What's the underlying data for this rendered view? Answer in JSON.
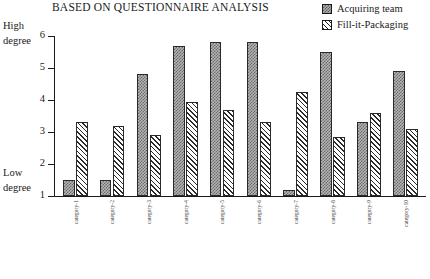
{
  "chart": {
    "title": "BASED ON QUESTIONNAIRE ANALYSIS",
    "axis": {
      "high_line1": "High",
      "high_line2": "degree",
      "low_line1": "Low",
      "low_line2": "degree",
      "ticks": [
        "6",
        "5",
        "4",
        "3",
        "2",
        "1"
      ]
    },
    "legend": [
      {
        "label": "Acquiring team",
        "swatch": "checker-swatch"
      },
      {
        "label": "Fill-it-Packaging",
        "swatch": "diagonal-hatch-swatch"
      }
    ]
  },
  "chart_data": {
    "type": "bar",
    "title": "BASED ON QUESTIONNAIRE ANALYSIS",
    "xlabel": "",
    "ylabel": "degree",
    "ylim": [
      1,
      6
    ],
    "yticks": [
      1,
      2,
      3,
      4,
      5,
      6
    ],
    "ytick_labels": [
      "1",
      "2",
      "3",
      "4",
      "5",
      "6"
    ],
    "y_axis_annotations": {
      "top": "High degree",
      "bottom": "Low degree"
    },
    "grid": false,
    "legend_position": "top-right",
    "categories": [
      "category-1",
      "category-2",
      "category-3",
      "category-4",
      "category-5",
      "category-6",
      "category-7",
      "category-8",
      "category-9",
      "category-10"
    ],
    "category_labels_legible": false,
    "category_label_note": "Rotated 90 degree axis labels are rendered below legible resolution in the source image",
    "series": [
      {
        "name": "Acquiring team",
        "values": [
          1.5,
          1.5,
          4.8,
          5.7,
          5.8,
          5.8,
          1.2,
          5.5,
          3.3,
          4.9
        ]
      },
      {
        "name": "Fill-it-Packaging",
        "values": [
          3.3,
          3.2,
          2.9,
          3.95,
          3.7,
          3.3,
          4.25,
          2.85,
          3.6,
          3.1
        ]
      }
    ]
  }
}
